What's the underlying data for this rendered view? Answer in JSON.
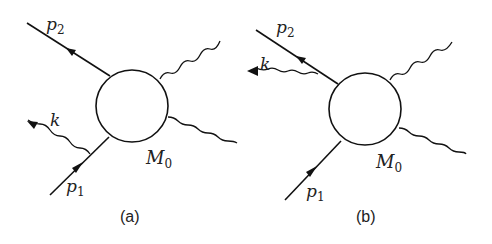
{
  "panels": [
    {
      "caption": "(a)",
      "labels": {
        "p2": "p",
        "p2_sub": "2",
        "k": "k",
        "m0": "M",
        "m0_sub": "0",
        "p1": "p",
        "p1_sub": "1"
      },
      "description": "Photon k emitted from incoming line p1 before the blob M0"
    },
    {
      "caption": "(b)",
      "labels": {
        "p2": "p",
        "p2_sub": "2",
        "k": "k",
        "m0": "M",
        "m0_sub": "0",
        "p1": "p",
        "p1_sub": "1"
      },
      "description": "Photon k emitted from outgoing line p2 after the blob M0"
    }
  ],
  "colors": {
    "line": "#111111",
    "background": "#ffffff"
  }
}
